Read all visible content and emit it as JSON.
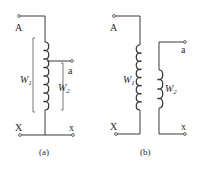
{
  "figure": {
    "panel_a": {
      "caption": "(a)",
      "terminals": {
        "top_left": "A",
        "tap": "a",
        "bottom_left": "X",
        "bottom_right": "x"
      },
      "windings": [
        {
          "symbol": "W",
          "subscript": "1"
        },
        {
          "symbol": "W",
          "subscript": "2"
        }
      ]
    },
    "panel_b": {
      "caption": "(b)",
      "terminals": {
        "top_left": "A",
        "top_right": "a",
        "bottom_left": "X",
        "bottom_right": "x"
      },
      "windings": [
        {
          "symbol": "W",
          "subscript": "1"
        },
        {
          "symbol": "W",
          "subscript": "2"
        }
      ]
    }
  }
}
